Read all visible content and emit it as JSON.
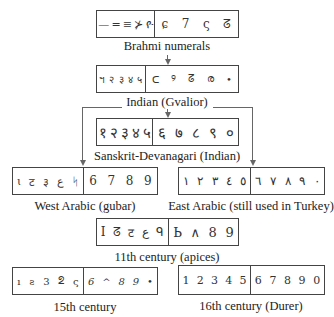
{
  "nodes": [
    {
      "id": "brahmi",
      "label": "Brahmi numerals",
      "left": [
        "—",
        "=",
        "≡",
        "⊁",
        "ዮ"
      ],
      "right": [
        "ɕ",
        "7",
        "ς",
        "ᘔ"
      ]
    },
    {
      "id": "gvalior",
      "label": "Indian (Gvalior)",
      "left": [
        "ฯ",
        "२",
        "३",
        "४",
        "५"
      ],
      "right": [
        "ᑕ",
        "୨",
        "ᘔ",
        "ര",
        "•"
      ]
    },
    {
      "id": "devanagari",
      "label": "Sanskrit-Devanagari (Indian)",
      "left": [
        "१",
        "२",
        "३",
        "४",
        "५"
      ],
      "right": [
        "६",
        "७",
        "८",
        "९",
        "०"
      ]
    },
    {
      "id": "west_arabic",
      "label": "West Arabic (gubar)",
      "left": [
        "ɩ",
        "ट",
        "३",
        "ﻉ",
        "ᛋ"
      ],
      "right": [
        "6",
        "7",
        "8",
        "9"
      ]
    },
    {
      "id": "east_arabic",
      "label": "East Arabic (still used in Turkey)",
      "left": [
        "١",
        "٢",
        "٣",
        "٤",
        "٥"
      ],
      "right": [
        "٦",
        "٧",
        "٨",
        "٩",
        "٠"
      ]
    },
    {
      "id": "apices",
      "label": "11th century (apices)",
      "left": [
        "I",
        "ᘔ",
        "ट",
        "ﻉ",
        "ᑫ"
      ],
      "right": [
        "Ь",
        "∧",
        "8",
        "9"
      ]
    },
    {
      "id": "c15",
      "label": "15th century",
      "left": [
        "ı",
        "ꙅ",
        "3",
        "ᘖ",
        "ς"
      ],
      "right": [
        "6",
        "^",
        "8",
        "9",
        "•"
      ]
    },
    {
      "id": "c16",
      "label": "16th century (Durer)",
      "left": [
        "1",
        "2",
        "3",
        "4",
        "5"
      ],
      "right": [
        "6",
        "7",
        "8",
        "9",
        "0"
      ]
    }
  ],
  "edges": [
    {
      "from": "brahmi",
      "to": "gvalior"
    },
    {
      "from": "gvalior",
      "to": "devanagari"
    },
    {
      "from": "gvalior",
      "to": "west_arabic"
    },
    {
      "from": "gvalior",
      "to": "east_arabic"
    }
  ],
  "colors": {
    "line": "#666666",
    "border": "#444444",
    "text": "#222222"
  }
}
